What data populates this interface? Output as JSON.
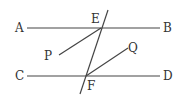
{
  "diagram": {
    "type": "geometry",
    "colors": {
      "stroke": "#444444",
      "text": "#333333",
      "background": "#ffffff"
    },
    "labels": {
      "A": "A",
      "B": "B",
      "C": "C",
      "D": "D",
      "E": "E",
      "F": "F",
      "P": "P",
      "Q": "Q"
    },
    "lines": [
      {
        "name": "AB",
        "from": "A",
        "to": "B"
      },
      {
        "name": "CD",
        "from": "C",
        "to": "D"
      },
      {
        "name": "transversal",
        "through": [
          "E",
          "F"
        ]
      },
      {
        "name": "EP",
        "from": "E",
        "to": "P"
      },
      {
        "name": "FQ",
        "from": "F",
        "to": "Q"
      }
    ]
  }
}
